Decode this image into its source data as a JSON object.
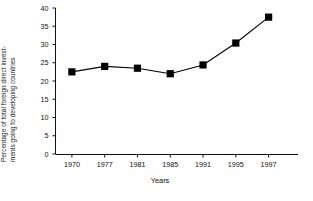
{
  "chart_data": {
    "type": "line",
    "title": "",
    "subtitle": "",
    "xlabel": "Years",
    "ylabel": "Percentage of total foreign direct invest-ments going to developing countries",
    "ylabel_line1": "Percentage of total foreign direct invest-",
    "ylabel_line2": "ments going to developing countries",
    "categories": [
      "1970",
      "1977",
      "1981",
      "1985",
      "1991",
      "1995",
      "1997"
    ],
    "values": [
      22.5,
      24.0,
      23.5,
      22.0,
      24.4,
      30.4,
      37.5
    ],
    "ylim": [
      0,
      40
    ],
    "ytick_labels": [
      "0",
      "5",
      "10",
      "15",
      "20",
      "25",
      "30",
      "35",
      "40"
    ],
    "ytick_values": [
      0,
      5,
      10,
      15,
      20,
      25,
      30,
      35,
      40
    ],
    "xtick_labels": [
      "1970",
      "1977",
      "1981",
      "1985",
      "1991",
      "1995",
      "1997"
    ],
    "grid": false,
    "legend": false,
    "legend_position": "none",
    "marker": "filled-square",
    "line_color": "#000000",
    "marker_color": "#000000",
    "axis_color": "#111111",
    "background_color": "#ffffff"
  }
}
